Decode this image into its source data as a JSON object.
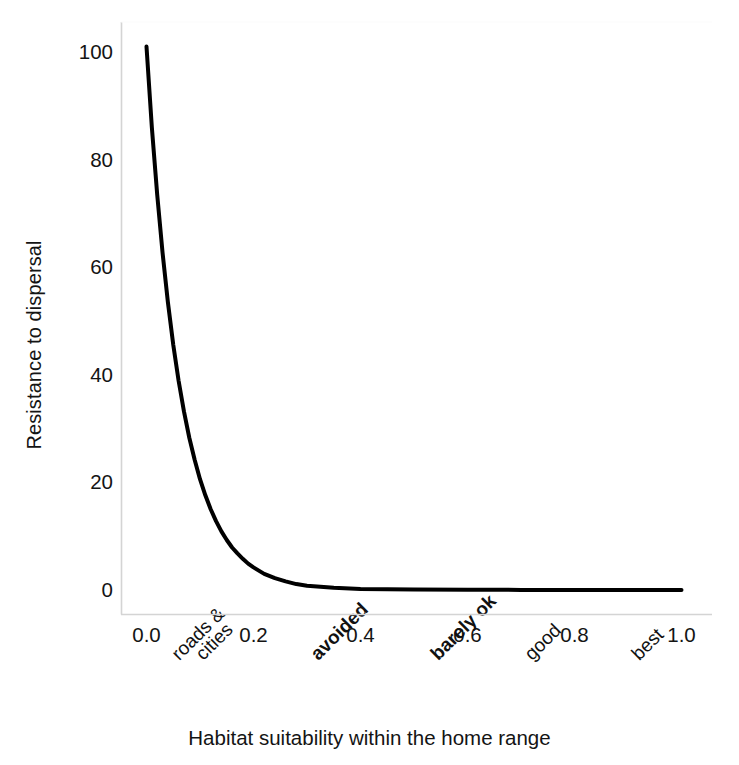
{
  "chart_data": {
    "type": "line",
    "title": "",
    "xlabel": "Habitat suitability within the home range",
    "ylabel": "Resistance to dispersal",
    "xlim": [
      0.0,
      1.0
    ],
    "ylim": [
      0,
      105
    ],
    "grid": false,
    "legend": null,
    "xticks": [
      "0.0",
      "0.2",
      "0.4",
      "0.6",
      "0.8",
      "1.0"
    ],
    "xtick_values": [
      0.0,
      0.2,
      0.4,
      0.6,
      0.8,
      1.0
    ],
    "yticks": [
      "0",
      "20",
      "40",
      "60",
      "80",
      "100"
    ],
    "ytick_values": [
      0,
      20,
      40,
      60,
      80,
      100
    ],
    "category_annotations": [
      {
        "label": "roads &",
        "x": 0.04,
        "bold": false
      },
      {
        "label": "cities",
        "x": 0.085,
        "bold": false
      },
      {
        "label": "avoided",
        "x": 0.3,
        "bold": true
      },
      {
        "label": "barely ok",
        "x": 0.525,
        "bold": true
      },
      {
        "label": "good",
        "x": 0.7,
        "bold": false
      },
      {
        "label": "best",
        "x": 0.9,
        "bold": false
      }
    ],
    "series": [
      {
        "name": "resistance",
        "color": "#000000",
        "linewidth": 4,
        "x": [
          0.0,
          0.01,
          0.02,
          0.03,
          0.04,
          0.05,
          0.06,
          0.07,
          0.08,
          0.09,
          0.1,
          0.11,
          0.12,
          0.13,
          0.14,
          0.15,
          0.16,
          0.17,
          0.18,
          0.19,
          0.2,
          0.22,
          0.24,
          0.26,
          0.28,
          0.3,
          0.325,
          0.35,
          0.4,
          0.45,
          0.5,
          0.6,
          0.7,
          0.8,
          0.9,
          1.0
        ],
        "y": [
          101.0,
          86.0,
          73.5,
          62.7,
          53.5,
          45.6,
          38.9,
          33.2,
          28.3,
          24.2,
          20.6,
          17.6,
          15.0,
          12.8,
          10.9,
          9.3,
          7.9,
          6.8,
          5.8,
          4.9,
          4.2,
          3.0,
          2.2,
          1.6,
          1.1,
          0.8,
          0.6,
          0.4,
          0.2,
          0.12,
          0.08,
          0.04,
          0.02,
          0.01,
          0.005,
          0.0
        ]
      }
    ],
    "equation_note": "y ≈ 100·exp(-x/0.0635)"
  },
  "axes": {
    "axis_color": "#d4d4d4",
    "text_color": "#141414"
  }
}
